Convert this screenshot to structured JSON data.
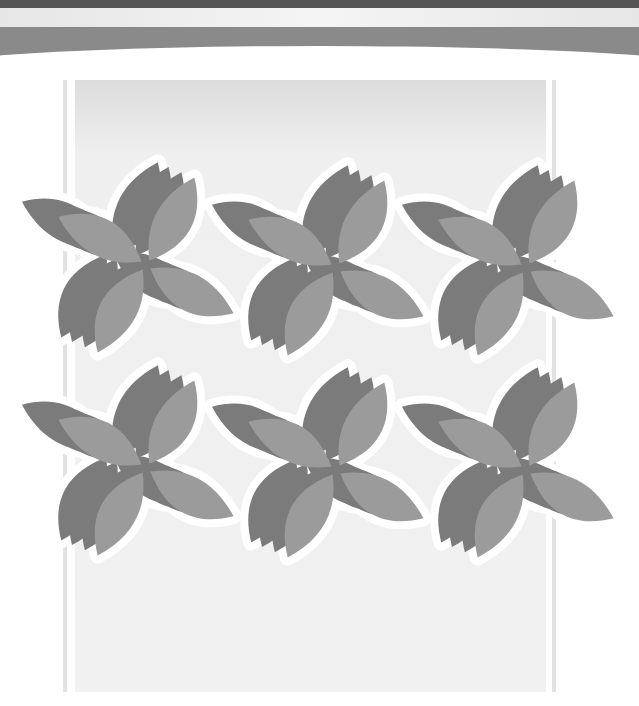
{
  "image": {
    "description": "Grayscale decorative pattern of six four-petal flower tiles with extruded 3D petals on a light panel",
    "colors": {
      "top_bar": "#555555",
      "band": "#8a8a8a",
      "panel": "#efefef",
      "petal_face": "#9b9b9b",
      "petal_side": "#7b7b7b",
      "outline": "#ffffff"
    },
    "tiles": [
      {
        "cx": 146,
        "cy": 265
      },
      {
        "cx": 336,
        "cy": 268
      },
      {
        "cx": 526,
        "cy": 268
      },
      {
        "cx": 146,
        "cy": 468
      },
      {
        "cx": 336,
        "cy": 470
      },
      {
        "cx": 526,
        "cy": 470
      }
    ],
    "tile_count": 6,
    "petals_per_tile": 4
  }
}
